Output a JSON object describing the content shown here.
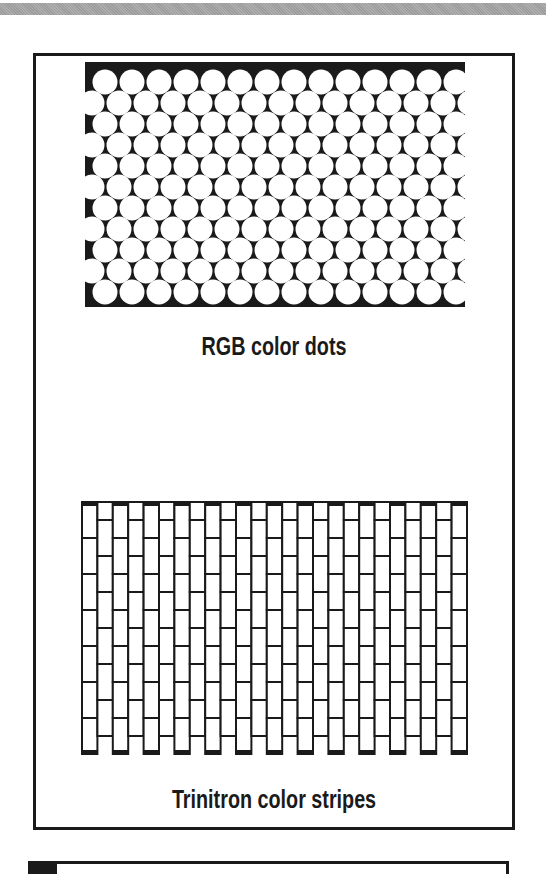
{
  "page": {
    "background": "#ffffff",
    "ink": "#1a1a1a",
    "top_rule_color": "#a5a5a5"
  },
  "figures": {
    "rgb_dots": {
      "label": "RGB color dots",
      "pattern": {
        "type": "dot-grid",
        "width": 380,
        "height": 245,
        "rows": 11,
        "cols": 14,
        "h_pitch": 27,
        "v_pitch": 21,
        "dot_radius": 12.5,
        "first_row_y": 20,
        "even_row_start": 20,
        "odd_row_start": 7,
        "bg_color": "#1a1a1a",
        "dot_color": "#ffffff"
      }
    },
    "trinitron": {
      "label": "Trinitron color stripes",
      "pattern": {
        "type": "stripe-grid",
        "width": 385,
        "height": 252,
        "columns": 25,
        "rows": 7,
        "cell_w": 15.4,
        "cell_h": 36,
        "half_offset": 18,
        "stroke_w": 2,
        "cap_h": 4,
        "stroke_color": "#1a1a1a",
        "fill_color": "#ffffff"
      }
    }
  }
}
